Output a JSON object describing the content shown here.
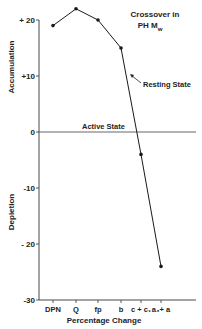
{
  "chart_data": {
    "type": "line",
    "title_lines": [
      "Crossover in",
      "PH M"
    ],
    "title_subscript": "w",
    "xlabel": "Percentage Change",
    "ylabel_top": "Accumulation",
    "ylabel_bottom": "Depletion",
    "categories": [
      "DPN",
      "Q",
      "fp",
      "b",
      "c+c1",
      "a3+a"
    ],
    "category_labels": [
      "DPN",
      "Q",
      "fp",
      "b",
      "c + c₁",
      "a₃+ a"
    ],
    "values": [
      19,
      22,
      20,
      15,
      -4,
      -24
    ],
    "ylim": [
      -30,
      22
    ],
    "yticks": [
      20,
      10,
      0,
      -10,
      -20,
      -30
    ],
    "ytick_labels": [
      "+ 20",
      "+10",
      "0",
      "-10",
      "- 20",
      "-30"
    ],
    "annotations": [
      {
        "text": "Resting State",
        "points_to_category": "b",
        "note": "arrow to line segment between b and c+c1"
      },
      {
        "text": "Active State",
        "at_y": 0
      }
    ],
    "reference_line": {
      "y": 0,
      "label": "Active State"
    },
    "grid": false,
    "legend": "none",
    "colors": {
      "line": "#1a1a1a",
      "axis": "#333333",
      "text": "#222222"
    }
  }
}
